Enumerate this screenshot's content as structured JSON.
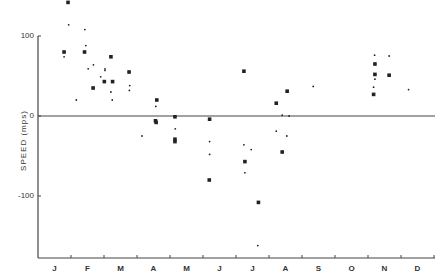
{
  "chart_data": {
    "type": "scatter",
    "title": "",
    "xlabel": "",
    "ylabel": "SPEED (mps)",
    "ylim": [
      -180,
      145
    ],
    "yticks": [
      100,
      0,
      -100
    ],
    "ytick_labels": [
      "100",
      "0",
      "-100"
    ],
    "categories": [
      "J",
      "F",
      "M",
      "A",
      "M",
      "J",
      "J",
      "A",
      "S",
      "O",
      "N",
      "D"
    ],
    "grid": false,
    "zero_line": true,
    "legend": null,
    "series": [
      {
        "name": "square markers",
        "marker": "square",
        "points": [
          {
            "m": 0.91,
            "v": 142
          },
          {
            "m": 0.79,
            "v": 80
          },
          {
            "m": 1.41,
            "v": 80
          },
          {
            "m": 2.21,
            "v": 74
          },
          {
            "m": 2.76,
            "v": 55
          },
          {
            "m": 2.01,
            "v": 43
          },
          {
            "m": 2.26,
            "v": 43
          },
          {
            "m": 1.67,
            "v": 35
          },
          {
            "m": 3.6,
            "v": 20
          },
          {
            "m": 3.56,
            "v": -6
          },
          {
            "m": 3.58,
            "v": -8
          },
          {
            "m": 4.15,
            "v": -1
          },
          {
            "m": 4.15,
            "v": -29
          },
          {
            "m": 4.15,
            "v": -32
          },
          {
            "m": 5.2,
            "v": -4
          },
          {
            "m": 5.19,
            "v": -80
          },
          {
            "m": 6.24,
            "v": 56
          },
          {
            "m": 6.27,
            "v": -57
          },
          {
            "m": 6.68,
            "v": -108
          },
          {
            "m": 7.55,
            "v": 31
          },
          {
            "m": 7.22,
            "v": 16
          },
          {
            "m": 7.4,
            "v": -45
          },
          {
            "m": 10.21,
            "v": 65
          },
          {
            "m": 10.21,
            "v": 52
          },
          {
            "m": 10.64,
            "v": 51
          },
          {
            "m": 10.17,
            "v": 27
          }
        ]
      },
      {
        "name": "dot markers",
        "marker": "dot",
        "points": [
          {
            "m": 0.93,
            "v": 114
          },
          {
            "m": 1.42,
            "v": 108
          },
          {
            "m": 1.45,
            "v": 88
          },
          {
            "m": 0.79,
            "v": 74
          },
          {
            "m": 1.68,
            "v": 64
          },
          {
            "m": 1.52,
            "v": 59
          },
          {
            "m": 2.03,
            "v": 59
          },
          {
            "m": 2.03,
            "v": 57
          },
          {
            "m": 1.9,
            "v": 49
          },
          {
            "m": 2.78,
            "v": 38
          },
          {
            "m": 2.21,
            "v": 30
          },
          {
            "m": 2.77,
            "v": 32
          },
          {
            "m": 1.16,
            "v": 20
          },
          {
            "m": 2.25,
            "v": 20
          },
          {
            "m": 3.15,
            "v": -25
          },
          {
            "m": 3.57,
            "v": 12
          },
          {
            "m": 4.16,
            "v": -16
          },
          {
            "m": 5.2,
            "v": -32
          },
          {
            "m": 5.2,
            "v": -48
          },
          {
            "m": 6.24,
            "v": -36
          },
          {
            "m": 6.46,
            "v": -42
          },
          {
            "m": 6.27,
            "v": -71
          },
          {
            "m": 6.66,
            "v": -162
          },
          {
            "m": 7.4,
            "v": 1
          },
          {
            "m": 7.61,
            "v": 0
          },
          {
            "m": 7.22,
            "v": -19
          },
          {
            "m": 7.54,
            "v": -25
          },
          {
            "m": 8.34,
            "v": 37
          },
          {
            "m": 10.2,
            "v": 76
          },
          {
            "m": 10.64,
            "v": 75
          },
          {
            "m": 10.21,
            "v": 46
          },
          {
            "m": 10.17,
            "v": 36
          },
          {
            "m": 11.23,
            "v": 33
          }
        ]
      }
    ]
  },
  "axis": {
    "ylabel": "SPEED (mps)",
    "yticks": [
      {
        "label": "100",
        "v": 100
      },
      {
        "label": "0",
        "v": 0
      },
      {
        "label": "-100",
        "v": -100
      }
    ],
    "months": [
      "J",
      "F",
      "M",
      "A",
      "M",
      "J",
      "J",
      "A",
      "S",
      "O",
      "N",
      "D"
    ]
  },
  "layout": {
    "x0": 38,
    "month_px": 33,
    "y0": 116,
    "px_per_unit": 0.8,
    "axis_top": 36,
    "axis_bottom": 258,
    "axis_right": 435,
    "colors": {
      "axis": "#444444",
      "marker": "#222222",
      "background": "#ffffff"
    }
  }
}
